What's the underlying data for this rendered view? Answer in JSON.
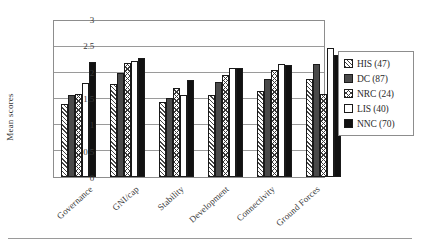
{
  "chart_data": {
    "type": "bar",
    "title": "",
    "xlabel": "",
    "ylabel": "Mean scores",
    "ylim": [
      0,
      3
    ],
    "yticks": [
      "0",
      "0.5",
      "1",
      "1.5",
      "2",
      "2.5",
      "3"
    ],
    "ytick_values": [
      0,
      0.5,
      1,
      1.5,
      2,
      2.5,
      3
    ],
    "grid": true,
    "legend_position": "right",
    "categories": [
      "Governance",
      "GNI/cap",
      "Stability",
      "Development",
      "Connectivity",
      "Ground Forces"
    ],
    "series": [
      {
        "name": "HIS (47)",
        "key": "HIS",
        "count": 47,
        "pattern": "diagonal-hatch",
        "values": [
          1.4,
          1.78,
          1.45,
          1.58,
          1.65,
          1.89
        ]
      },
      {
        "name": "DC (87)",
        "key": "DC",
        "count": 87,
        "pattern": "solid-dark-gray",
        "values": [
          1.58,
          2.0,
          1.51,
          1.83,
          1.88,
          2.18
        ]
      },
      {
        "name": "NRC (24)",
        "key": "NRC",
        "count": 24,
        "pattern": "cross-hatch",
        "values": [
          1.59,
          2.2,
          1.71,
          1.96,
          2.05,
          1.6
        ]
      },
      {
        "name": "LIS (40)",
        "key": "LIS",
        "count": 40,
        "pattern": "white",
        "values": [
          1.81,
          2.24,
          1.58,
          2.1,
          2.17,
          2.48
        ]
      },
      {
        "name": "NNC (70)",
        "key": "NNC",
        "count": 70,
        "pattern": "solid-black",
        "values": [
          2.22,
          2.29,
          1.87,
          2.1,
          2.16,
          2.35
        ]
      }
    ]
  },
  "colors": {
    "axis": "#8d8d8d",
    "grid": "#9a9a9a",
    "text": "#2b2b2b",
    "his": "#ffffff",
    "dc": "#4a4a4a",
    "nrc": "#ffffff",
    "lis": "#ffffff",
    "nnc": "#111111"
  }
}
